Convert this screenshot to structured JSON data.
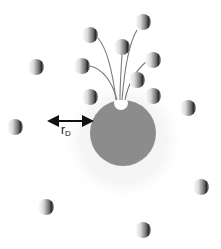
{
  "figure": {
    "label": {
      "main": "r",
      "subscript": "D",
      "x": 61,
      "y": 124
    },
    "disc": {
      "cx": 123,
      "cy": 133,
      "r": 33,
      "color": "#8c8c8c"
    },
    "halo": {
      "cx": 123,
      "cy": 140,
      "r": 62,
      "color": "#f4f4f4"
    },
    "pore": {
      "cx": 121,
      "cy": 103,
      "r": 7,
      "color": "#ffffff"
    },
    "arrow": {
      "x1": 53,
      "y1": 121,
      "x2": 88,
      "y2": 121,
      "color": "#111111"
    },
    "spheres": [
      {
        "cx": 90,
        "cy": 35
      },
      {
        "cx": 143,
        "cy": 22
      },
      {
        "cx": 122,
        "cy": 47
      },
      {
        "cx": 82,
        "cy": 66
      },
      {
        "cx": 153,
        "cy": 60
      },
      {
        "cx": 137,
        "cy": 80
      },
      {
        "cx": 90,
        "cy": 97
      },
      {
        "cx": 153,
        "cy": 96
      },
      {
        "cx": 188,
        "cy": 108
      },
      {
        "cx": 36,
        "cy": 67
      },
      {
        "cx": 15,
        "cy": 127
      },
      {
        "cx": 46,
        "cy": 207
      },
      {
        "cx": 201,
        "cy": 187
      },
      {
        "cx": 143,
        "cy": 230
      }
    ],
    "tails": [
      {
        "d": "M 98 38 C 108 50, 113 75, 116 100"
      },
      {
        "d": "M 137 30 C 128 45, 124 75, 122 100"
      },
      {
        "d": "M 122 55 C 121 70, 120 85, 120 100"
      },
      {
        "d": "M 90 66 C 106 70, 113 85, 117 100"
      },
      {
        "d": "M 146 62 C 134 72, 128 85, 125 100"
      }
    ],
    "sphere_radius": 8
  }
}
